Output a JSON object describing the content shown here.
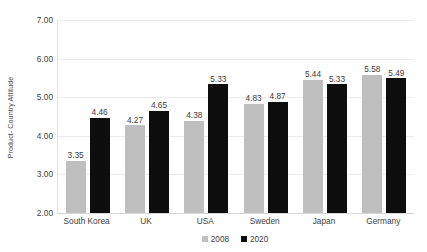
{
  "chart_data": {
    "type": "bar",
    "title": "",
    "subtitle": "",
    "xlabel": "",
    "ylabel": "Product- Country Attitude",
    "categories": [
      "South Korea",
      "UK",
      "USA",
      "Sweden",
      "Japan",
      "Germany"
    ],
    "series": [
      {
        "name": "2008",
        "color": "#bfbfbf",
        "values": [
          3.35,
          4.27,
          4.38,
          4.83,
          5.44,
          5.58
        ]
      },
      {
        "name": "2020",
        "color": "#0d0d0d",
        "values": [
          4.46,
          4.65,
          5.33,
          4.87,
          5.33,
          5.49
        ]
      }
    ],
    "data_labels": [
      [
        "3.35",
        "4.46"
      ],
      [
        "4.27",
        "4.65"
      ],
      [
        "4.38",
        "5.33"
      ],
      [
        "4.83",
        "4.87"
      ],
      [
        "5.44",
        "5.33"
      ],
      [
        "5.58",
        "5.49"
      ]
    ],
    "ylim": [
      2.0,
      7.0
    ],
    "ytick_values": [
      7.0,
      6.0,
      5.0,
      4.0,
      3.0,
      2.0
    ],
    "ytick_labels": [
      "7.00",
      "6.00",
      "5.00",
      "4.00",
      "3.00",
      "2.00"
    ],
    "grid": "horizontal",
    "legend_position": "bottom-center",
    "legend_entries": [
      {
        "label": "2008",
        "color": "#bfbfbf",
        "marker": "square-swatch"
      },
      {
        "label": "2020",
        "color": "#0d0d0d",
        "marker": "square-swatch"
      }
    ],
    "plot_background": "#ffffff",
    "gridline_color": "#ececec"
  }
}
